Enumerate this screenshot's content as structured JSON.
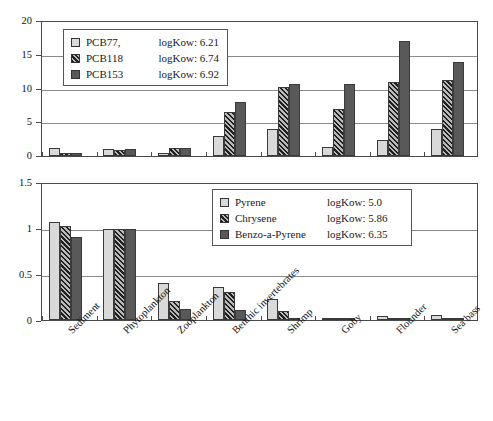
{
  "chart_data": [
    {
      "type": "bar",
      "title": "",
      "xlabel": "",
      "ylabel": "",
      "ylim": [
        0,
        20
      ],
      "yticks": [
        0,
        5,
        10,
        15,
        20
      ],
      "ytick_labels": [
        "0",
        "5",
        "10",
        "15",
        "20"
      ],
      "grid": true,
      "legend_position": "upper-left-inside",
      "categories": [
        "Sediment",
        "Phytoplankton",
        "Zooplankton",
        "Benthic invertebrates",
        "Shrimp",
        "Goby",
        "Flounder",
        "Sea bass"
      ],
      "series": [
        {
          "name": "PCB77,",
          "annotation": "logKow: 6.21",
          "color": "#d9d9d9",
          "fill": "solid-light",
          "values": [
            1.2,
            1.0,
            0.5,
            3.0,
            4.0,
            1.4,
            2.4,
            4.0
          ]
        },
        {
          "name": "PCB118",
          "annotation": "logKow: 6.74",
          "color": "#4f4f4f",
          "fill": "hatched",
          "values": [
            0.5,
            0.9,
            1.2,
            6.5,
            10.2,
            7.0,
            11.0,
            11.2
          ]
        },
        {
          "name": "PCB153",
          "annotation": "logKow: 6.92",
          "color": "#595959",
          "fill": "solid-dark",
          "values": [
            0.5,
            1.0,
            1.2,
            8.0,
            10.7,
            10.7,
            17.0,
            14.0
          ]
        }
      ]
    },
    {
      "type": "bar",
      "title": "",
      "xlabel": "",
      "ylabel": "",
      "ylim": [
        0,
        1.5
      ],
      "yticks": [
        0,
        0.5,
        1,
        1.5
      ],
      "ytick_labels": [
        "0",
        "0.5",
        "1",
        "1.5"
      ],
      "grid": true,
      "legend_position": "upper-right-inside",
      "categories": [
        "Sediment",
        "Phytoplankton",
        "Zooplankton",
        "Benthic invertebrates",
        "Shrimp",
        "Goby",
        "Flounder",
        "Sea bass"
      ],
      "series": [
        {
          "name": "Pyrene",
          "annotation": "logKow: 5.0",
          "color": "#d9d9d9",
          "fill": "solid-light",
          "values": [
            1.07,
            1.0,
            0.4,
            0.36,
            0.23,
            0.01,
            0.04,
            0.06
          ]
        },
        {
          "name": "Chrysene",
          "annotation": "logKow: 5.86",
          "color": "#4f4f4f",
          "fill": "hatched",
          "values": [
            1.03,
            1.0,
            0.21,
            0.31,
            0.1,
            0.02,
            0.01,
            0.01
          ]
        },
        {
          "name": "Benzo-a-Pyrene",
          "annotation": "logKow: 6.35",
          "color": "#595959",
          "fill": "solid-dark",
          "values": [
            0.91,
            1.0,
            0.12,
            0.11,
            0.01,
            0.01,
            0.005,
            0.005
          ]
        }
      ]
    }
  ],
  "top_chart": {
    "legend": {
      "rows": [
        {
          "label": "PCB77,",
          "kow": "logKow: 6.21"
        },
        {
          "label": "PCB118",
          "kow": "logKow: 6.74"
        },
        {
          "label": "PCB153",
          "kow": "logKow: 6.92"
        }
      ]
    },
    "y_axis": {
      "labels": [
        "20",
        "15",
        "10",
        "5",
        "0"
      ]
    }
  },
  "bottom_chart": {
    "legend": {
      "rows": [
        {
          "label": "Pyrene",
          "kow": "logKow: 5.0"
        },
        {
          "label": "Chrysene",
          "kow": "logKow: 5.86"
        },
        {
          "label": "Benzo-a-Pyrene",
          "kow": "logKow: 6.35"
        }
      ]
    },
    "y_axis": {
      "labels": [
        "1.5",
        "1",
        "0.5",
        "0"
      ]
    }
  },
  "x_axis": {
    "categories": [
      "Sediment",
      "Phytoplankton",
      "Zooplankton",
      "Benthic invertebrates",
      "Shrimp",
      "Goby",
      "Flounder",
      "Sea bass"
    ]
  }
}
